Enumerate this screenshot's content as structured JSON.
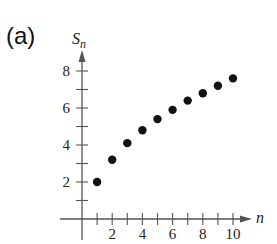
{
  "panel_label": "(a)",
  "chart_data": {
    "type": "scatter",
    "title": "",
    "xlabel": "n",
    "ylabel": "S_n",
    "ylabel_main": "S",
    "ylabel_sub": "n",
    "x": [
      1,
      2,
      3,
      4,
      5,
      6,
      7,
      8,
      9,
      10
    ],
    "values": [
      2.0,
      3.2,
      4.1,
      4.8,
      5.4,
      5.9,
      6.4,
      6.8,
      7.2,
      7.6
    ],
    "xlim": [
      0,
      10.5
    ],
    "ylim": [
      0,
      9
    ],
    "x_tick_labels": [
      "2",
      "4",
      "6",
      "8",
      "10"
    ],
    "x_tick_values": [
      2,
      4,
      6,
      8,
      10
    ],
    "y_tick_labels": [
      "2",
      "4",
      "6",
      "8"
    ],
    "y_tick_values": [
      2,
      4,
      6,
      8
    ],
    "grid": false,
    "legend": null,
    "point_color": "#111111",
    "axis_color": "#555555"
  }
}
